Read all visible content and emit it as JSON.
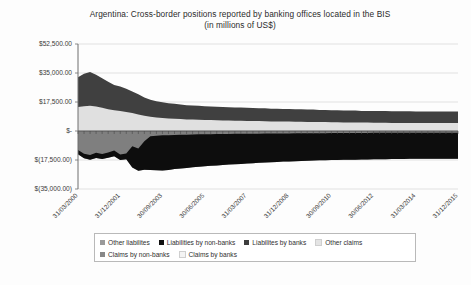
{
  "chart_data": {
    "type": "area",
    "title": "Argentina: Cross-border positions reported by banking offices located in the BIS",
    "subtitle": "(in millions of US$)",
    "xlabel": "",
    "ylabel": "",
    "grid": true,
    "legend_position": "bottom",
    "stacked": true,
    "ylim": [
      -35000,
      52500
    ],
    "ytick_values": [
      52500,
      35000,
      17500,
      0,
      -17500,
      -35000
    ],
    "ytick_labels": [
      "$52,500.00",
      "$35,000.00",
      "$17,500.00",
      "$-",
      "$(17,500.00)",
      "$(35,000.00)"
    ],
    "xtick_labels": [
      "31/03/2000",
      "31/12/2001",
      "30/09/2003",
      "30/06/2005",
      "31/03/2007",
      "31/12/2008",
      "30/09/2010",
      "30/06/2012",
      "31/03/2014",
      "31/12/2015"
    ],
    "x_range": [
      "31/03/2000",
      "31/12/2015"
    ],
    "colors": {
      "other_liabilities": "#7f7f7f",
      "liabilities_by_non_banks": "#0d0d0d",
      "liabilities_by_banks": "#404040",
      "other_claims": "#e0e0e0",
      "claims_by_non_banks": "#808080",
      "claims_by_banks": "#f2f2f2",
      "gridline": "#d4d4d4",
      "axis": "#6e6e6e"
    },
    "series": [
      {
        "name": "Other liabilites",
        "color": "#7f7f7f",
        "sign": "negative",
        "values": [
          -11500,
          -13800,
          -14500,
          -13200,
          -13900,
          -13000,
          -11800,
          -14200,
          -13600,
          -9200,
          -10500,
          -6200,
          -3100,
          -2900,
          -2600,
          -2500,
          -2400,
          -2300,
          -2200,
          -2100,
          -2000,
          -1950,
          -1900,
          -1850,
          -1800,
          -1750,
          -1700,
          -1700,
          -1650,
          -1600,
          -1600,
          -1550,
          -1500,
          -1500,
          -1450,
          -1450,
          -1400,
          -1400,
          -1350,
          -1350,
          -1300,
          -1300,
          -1250,
          -1250,
          -1200,
          -1200,
          -1200,
          -1150,
          -1150,
          -1100,
          -1100,
          -1100,
          -1050,
          -1050,
          -1050,
          -1000,
          -1000,
          -1000,
          -1000,
          -1000,
          -1000,
          -1000,
          -1000,
          -1000
        ]
      },
      {
        "name": "Liabilities by non-banks",
        "color": "#0d0d0d",
        "sign": "negative",
        "values": [
          -2500,
          -2700,
          -2900,
          -3100,
          -3000,
          -3200,
          -3400,
          -3300,
          -3500,
          -12800,
          -13500,
          -17200,
          -20500,
          -20800,
          -21200,
          -21000,
          -20600,
          -20300,
          -20100,
          -19800,
          -19500,
          -19300,
          -19100,
          -18900,
          -18700,
          -18500,
          -18300,
          -18200,
          -18000,
          -17800,
          -17600,
          -17500,
          -17300,
          -17200,
          -17000,
          -16900,
          -16800,
          -16700,
          -16600,
          -16500,
          -16400,
          -16400,
          -16300,
          -16200,
          -16200,
          -16100,
          -16100,
          -16000,
          -16000,
          -15900,
          -15900,
          -15900,
          -15800,
          -15800,
          -15800,
          -15800,
          -15700,
          -15700,
          -15700,
          -15700,
          -15700,
          -15700,
          -15700,
          -15700
        ]
      },
      {
        "name": "Liabilites by banks",
        "color": "#404040",
        "sign": "positive_upper",
        "values": [
          18000,
          19500,
          20400,
          19200,
          17800,
          16500,
          15200,
          14800,
          14000,
          13000,
          12200,
          11000,
          10200,
          9800,
          9400,
          9200,
          9000,
          8800,
          8600,
          8500,
          8400,
          8300,
          8200,
          8200,
          8100,
          8100,
          8000,
          8000,
          7900,
          7900,
          7800,
          7800,
          7700,
          7700,
          7600,
          7600,
          7500,
          7500,
          7400,
          7400,
          7300,
          7300,
          7200,
          7200,
          7100,
          7100,
          7100,
          7000,
          7000,
          7000,
          7000,
          7000,
          7000,
          7000,
          7000,
          7000,
          6900,
          6900,
          6900,
          6900,
          6900,
          6900,
          6900,
          6900
        ]
      },
      {
        "name": "Other claims",
        "color": "#e0e0e0",
        "sign": "positive_lower",
        "values": [
          14500,
          15000,
          15200,
          14800,
          14000,
          13200,
          12500,
          12000,
          11500,
          10800,
          10000,
          9200,
          8600,
          8200,
          7900,
          7600,
          7400,
          7200,
          7000,
          6900,
          6800,
          6700,
          6600,
          6500,
          6400,
          6300,
          6200,
          6200,
          6100,
          6000,
          6000,
          5900,
          5800,
          5800,
          5700,
          5700,
          5600,
          5600,
          5500,
          5500,
          5400,
          5400,
          5300,
          5300,
          5200,
          5200,
          5200,
          5100,
          5100,
          5000,
          5000,
          5000,
          4900,
          4900,
          4900,
          4900,
          4800,
          4800,
          4800,
          4800,
          4800,
          4800,
          4800,
          4800
        ]
      },
      {
        "name": "Claims by non-banks",
        "color": "#808080",
        "sign": "positive",
        "values": []
      },
      {
        "name": "Claims by banks",
        "color": "#f2f2f2",
        "sign": "positive",
        "values": []
      }
    ]
  },
  "legend": {
    "rows": [
      [
        {
          "label": "Other liabilites",
          "color": "#9a9a9a"
        },
        {
          "label": "Liabilities by non-banks",
          "color": "#111111"
        },
        {
          "label": "Liabilites by banks",
          "color": "#3d3d3d"
        },
        {
          "label": "Other claims",
          "color": "#e4e4e4"
        }
      ],
      [
        {
          "label": "Claims by non-banks",
          "color": "#888888"
        },
        {
          "label": "Claims by banks",
          "color": "#f4f4f4"
        }
      ]
    ]
  }
}
